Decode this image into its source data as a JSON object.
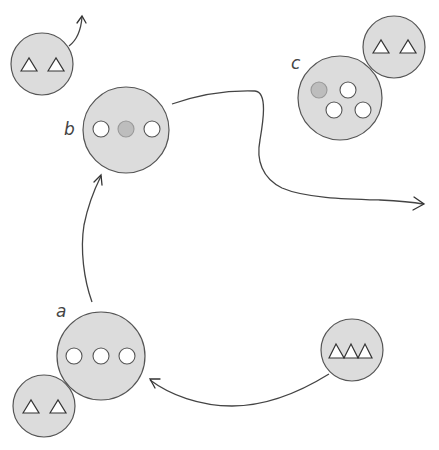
{
  "diagram": {
    "type": "process-cycle",
    "labels": {
      "a": "a",
      "b": "b",
      "c": "c"
    },
    "colors": {
      "cell_fill": "#dcdcdc",
      "outline": "#555555",
      "vesicle_empty": "#ffffff",
      "vesicle_filled": "#bdbdbd",
      "arrow": "#444444"
    },
    "nodes": [
      {
        "id": "small-top-left",
        "shape": "circle",
        "contents": "2 triangles",
        "cx": 42,
        "cy": 64,
        "r": 31
      },
      {
        "id": "b",
        "label": "b",
        "shape": "circle",
        "contents": "3 small circles (middle shaded)",
        "cx": 126,
        "cy": 130,
        "r": 43
      },
      {
        "id": "c",
        "label": "c",
        "shape": "circle",
        "contents": "4 small circles (one shaded)",
        "cx": 340,
        "cy": 98,
        "r": 42
      },
      {
        "id": "small-top-right",
        "shape": "circle",
        "contents": "2 triangles",
        "cx": 394,
        "cy": 47,
        "r": 31
      },
      {
        "id": "a",
        "label": "a",
        "shape": "circle",
        "contents": "3 small white circles",
        "cx": 101,
        "cy": 356,
        "r": 44
      },
      {
        "id": "small-bottom-left",
        "shape": "circle",
        "contents": "2 triangles",
        "cx": 44,
        "cy": 406,
        "r": 31
      },
      {
        "id": "small-bottom-right",
        "shape": "circle",
        "contents": "3 adjoining triangles",
        "cx": 352,
        "cy": 350,
        "r": 31
      }
    ],
    "edges": [
      {
        "from": "small-top-left",
        "to": "off-canvas-up"
      },
      {
        "from": "a",
        "to": "b"
      },
      {
        "from": "b",
        "to": "off-canvas-right"
      },
      {
        "from": "small-bottom-right",
        "to": "a"
      }
    ]
  }
}
